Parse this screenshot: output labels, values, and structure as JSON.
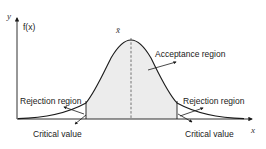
{
  "diagram": {
    "type": "normal-distribution-hypothesis-test",
    "y_axis_label": "y",
    "y_function_label": "f(x)",
    "x_axis_label": "x",
    "mean_label": "x̄",
    "labels": {
      "acceptance_region": "Acceptance region",
      "rejection_region_left": "Rejection region",
      "rejection_region_right": "Rejection region",
      "critical_value_left": "Critical value",
      "critical_value_right": "Critical value"
    },
    "colors": {
      "curve": "#1a1a1a",
      "shading": "#ececec",
      "dashed_mean": "#555555",
      "axis": "#1a1a1a"
    }
  }
}
